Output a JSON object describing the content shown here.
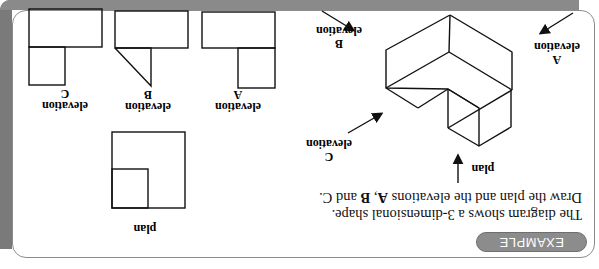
{
  "badge": {
    "label": "EXAMPLE"
  },
  "instructions": {
    "line1": "The diagram shows a 3-dimensional shape.",
    "line2_prefix": "Draw the plan and the elevations ",
    "line2_a": "A",
    "line2_sep": ", ",
    "line2_b": "B",
    "line2_and": " and ",
    "line2_c": "C",
    "line2_end": "."
  },
  "solid_labels": {
    "plan": "plan",
    "elevation_word": "elevation",
    "a": "A",
    "b": "B",
    "c": "C"
  },
  "answers": {
    "plan_label": "plan",
    "elevation_a": {
      "word": "elevation",
      "letter": "A"
    },
    "elevation_b": {
      "word": "elevation",
      "letter": "B"
    },
    "elevation_c": {
      "word": "elevation",
      "letter": "C"
    }
  },
  "colors": {
    "badge_fill": "#8c8c8c",
    "frame_grey": "#7a7a7a",
    "line": "#111111"
  },
  "orientation": "rotated 180 degrees"
}
